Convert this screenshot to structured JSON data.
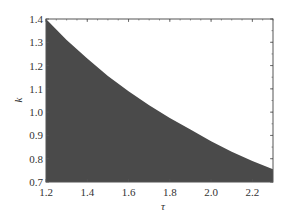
{
  "chart_data": {
    "type": "area",
    "title": "",
    "xlabel": "τ",
    "ylabel": "k",
    "xlim": [
      1.2,
      2.3
    ],
    "ylim": [
      0.7,
      1.4
    ],
    "xticks": [
      "1.2",
      "1.4",
      "1.6",
      "1.8",
      "2.0",
      "2.2"
    ],
    "yticks": [
      "0.7",
      "0.8",
      "0.9",
      "1.0",
      "1.1",
      "1.2",
      "1.3",
      "1.4"
    ],
    "grid": false,
    "legend": null,
    "fill_color": "#4a4a4a",
    "series": [
      {
        "name": "boundary",
        "x": [
          1.2,
          1.3,
          1.4,
          1.5,
          1.6,
          1.7,
          1.8,
          1.9,
          2.0,
          2.1,
          2.2,
          2.3
        ],
        "values": [
          1.4,
          1.31,
          1.23,
          1.155,
          1.09,
          1.03,
          0.975,
          0.925,
          0.875,
          0.83,
          0.79,
          0.755
        ]
      }
    ]
  }
}
